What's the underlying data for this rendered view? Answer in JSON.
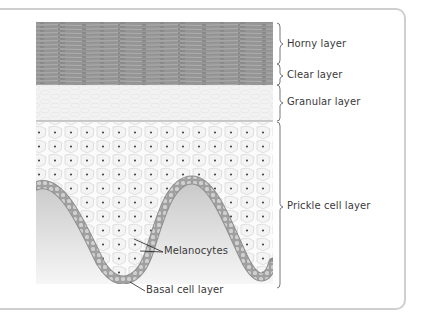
{
  "figure": {
    "type": "skin epidermis cross-section",
    "colors": {
      "frame": "#cfcfcf",
      "horny": "#8e8e8e",
      "granular": "#f3f3f3",
      "prickle_bg": "#fafafa",
      "basal": "#9a9a9a",
      "dermis": "#d2d2d2",
      "text": "#3a3a3a"
    }
  },
  "layers": [
    {
      "id": "horny",
      "label": "Horny layer"
    },
    {
      "id": "clear",
      "label": "Clear layer"
    },
    {
      "id": "granular",
      "label": "Granular layer"
    },
    {
      "id": "prickle",
      "label": "Prickle cell layer"
    }
  ],
  "callouts": [
    {
      "id": "melanocytes",
      "label": "Melanocytes"
    },
    {
      "id": "basal",
      "label": "Basal cell layer"
    }
  ]
}
